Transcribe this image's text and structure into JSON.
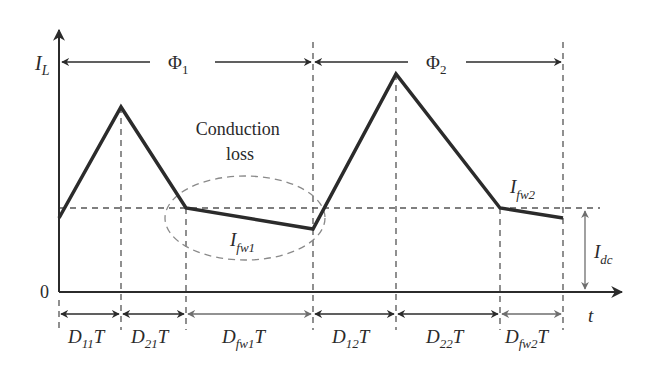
{
  "diagram": {
    "y_axis_label": "I",
    "y_axis_sub": "L",
    "x_axis_label": "t",
    "origin_label": "0",
    "annotation": {
      "line1": "Conduction",
      "line2": "loss"
    },
    "phases": [
      {
        "symbol": "Φ",
        "sub": "1"
      },
      {
        "symbol": "Φ",
        "sub": "2"
      }
    ],
    "currents": {
      "ifw1": {
        "main": "I",
        "sub": "fw1"
      },
      "ifw2": {
        "main": "I",
        "sub": "fw2"
      },
      "idc": {
        "main": "I",
        "sub": "dc"
      }
    },
    "intervals": [
      {
        "main": "D",
        "sub": "11",
        "tail": "T"
      },
      {
        "main": "D",
        "sub": "21",
        "tail": "T"
      },
      {
        "main": "D",
        "sub": "fw1",
        "tail": "T"
      },
      {
        "main": "D",
        "sub": "12",
        "tail": "T"
      },
      {
        "main": "D",
        "sub": "22",
        "tail": "T"
      },
      {
        "main": "D",
        "sub": "fw2",
        "tail": "T"
      }
    ],
    "colors": {
      "waveform": "#2b2b2b",
      "axis": "#2b2b2b",
      "dashed": "#555555",
      "freewheel_arrow": "#6e6e6e",
      "ellipse": "#8a8a8a"
    }
  }
}
